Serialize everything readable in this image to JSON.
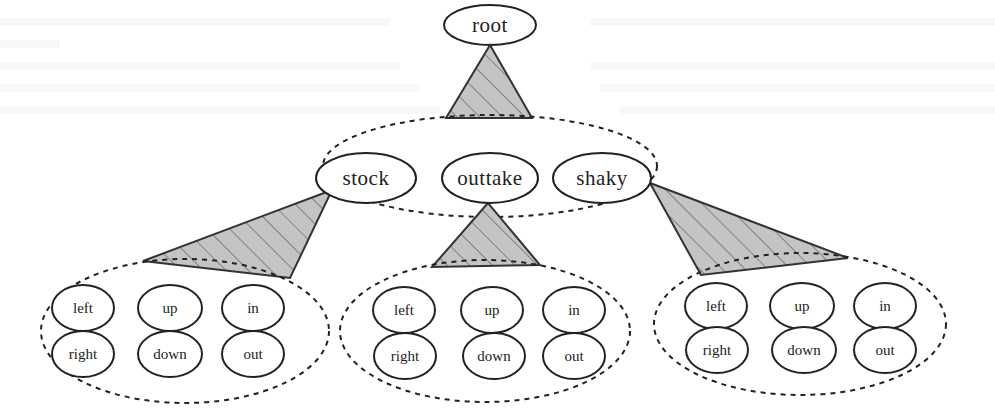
{
  "diagram": {
    "title": "",
    "root": {
      "label": "root"
    },
    "level1": {
      "nodes": [
        {
          "label": "stock"
        },
        {
          "label": "outtake"
        },
        {
          "label": "shaky"
        }
      ]
    },
    "level2_groups": [
      {
        "parent": "stock",
        "nodes": [
          {
            "label": "left"
          },
          {
            "label": "up"
          },
          {
            "label": "in"
          },
          {
            "label": "right"
          },
          {
            "label": "down"
          },
          {
            "label": "out"
          }
        ]
      },
      {
        "parent": "outtake",
        "nodes": [
          {
            "label": "left"
          },
          {
            "label": "up"
          },
          {
            "label": "in"
          },
          {
            "label": "right"
          },
          {
            "label": "down"
          },
          {
            "label": "out"
          }
        ]
      },
      {
        "parent": "shaky",
        "nodes": [
          {
            "label": "left"
          },
          {
            "label": "up"
          },
          {
            "label": "in"
          },
          {
            "label": "right"
          },
          {
            "label": "down"
          },
          {
            "label": "out"
          }
        ]
      }
    ],
    "colors": {
      "stroke": "#222222",
      "triangle_fill": "#c4c4c4",
      "hatch": "#555555",
      "background": "#ffffff"
    }
  }
}
